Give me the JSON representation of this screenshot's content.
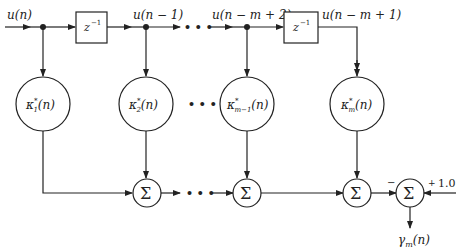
{
  "diagram": {
    "type": "lattice-predictor / transversal filter structure",
    "input": {
      "label": "u(n)"
    },
    "delay_blocks": [
      {
        "label": "z",
        "exp": "−1"
      },
      {
        "label": "z",
        "exp": "−1"
      }
    ],
    "taps": [
      {
        "label": "u(n − 1)"
      },
      {
        "label": "u(n − m + 2)"
      },
      {
        "label": "u(n − m + 1)"
      }
    ],
    "weights": [
      {
        "k": "κ",
        "star": "*",
        "sub": "1",
        "arg": "(n)"
      },
      {
        "k": "κ",
        "star": "*",
        "sub": "2",
        "arg": "(n)"
      },
      {
        "k": "κ",
        "star": "*",
        "sub": "m−1",
        "arg": "(n)"
      },
      {
        "k": "κ",
        "star": "*",
        "sub": "m",
        "arg": "(n)"
      }
    ],
    "summers": [
      {
        "symbol": "Σ"
      },
      {
        "symbol": "Σ"
      },
      {
        "symbol": "Σ"
      },
      {
        "symbol": "Σ"
      }
    ],
    "ellipsis": "• • •",
    "final_sum": {
      "minus_sign": "−",
      "plus_sign": "+",
      "constant": "1.0"
    },
    "output": {
      "label": "γ",
      "sub": "m",
      "arg": "(n)"
    }
  }
}
